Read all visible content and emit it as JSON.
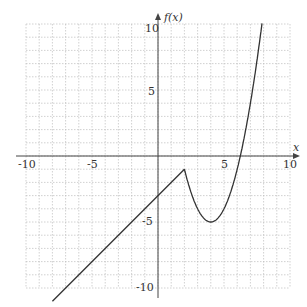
{
  "chart_data": {
    "type": "line",
    "title": "",
    "xlabel": "x",
    "ylabel": "f(x)",
    "xlim": [
      -10,
      10
    ],
    "ylim": [
      -10,
      10
    ],
    "grid": true,
    "x_ticks": [
      -10,
      -5,
      5,
      10
    ],
    "y_ticks": [
      10,
      5,
      -5,
      -10
    ],
    "x_tick_labels": [
      "-10",
      "-5",
      "5",
      "10"
    ],
    "y_tick_labels": [
      "10",
      "5",
      "-5",
      "-10"
    ],
    "series": [
      {
        "name": "f(x), x <= 2",
        "formula": "x - 3",
        "points": [
          [
            -8,
            -11
          ],
          [
            2,
            -1
          ]
        ]
      },
      {
        "name": "f(x), x > 2",
        "formula": "(x - 4)^2 - 5",
        "points": [
          [
            2,
            -1
          ],
          [
            3,
            -4
          ],
          [
            4,
            -5
          ],
          [
            5,
            -4
          ],
          [
            6,
            -1
          ],
          [
            6.24,
            0
          ],
          [
            7,
            4
          ],
          [
            7.9,
            10.2
          ]
        ]
      }
    ],
    "key_points": {
      "corner": [
        2,
        -1
      ],
      "minimum": [
        4,
        -5
      ],
      "y_intercept": [
        0,
        -3
      ],
      "x_intercept": [
        6.24,
        0
      ]
    }
  },
  "labels": {
    "x_axis": "x",
    "y_axis": "f(x)",
    "x_tick_neg10": "-10",
    "x_tick_neg5": "-5",
    "x_tick_5": "5",
    "x_tick_10": "10",
    "y_tick_10": "10",
    "y_tick_5": "5",
    "y_tick_neg5": "-5",
    "y_tick_neg10": "-10"
  },
  "colors": {
    "curve": "#333333",
    "axis": "#444444",
    "grid": "#bdbdbd"
  }
}
